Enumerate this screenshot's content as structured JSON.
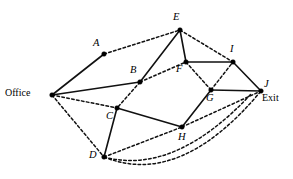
{
  "figure": {
    "type": "graph-diagram",
    "background_color": "#ffffff",
    "line_color": "#111111",
    "node_color": "#000000",
    "width": 293,
    "height": 179
  },
  "nodes": [
    {
      "id": "Office",
      "label": "Office",
      "style": "plain",
      "x": 52,
      "y": 95,
      "label_x": 5,
      "label_y": 88
    },
    {
      "id": "A",
      "label": "A",
      "style": "italic",
      "x": 104,
      "y": 54,
      "label_x": 93,
      "label_y": 38
    },
    {
      "id": "B",
      "label": "B",
      "style": "italic",
      "x": 140,
      "y": 82,
      "label_x": 130,
      "label_y": 65
    },
    {
      "id": "C",
      "label": "C",
      "style": "italic",
      "x": 117,
      "y": 108,
      "label_x": 106,
      "label_y": 111
    },
    {
      "id": "D",
      "label": "D",
      "style": "italic",
      "x": 104,
      "y": 157,
      "label_x": 89,
      "label_y": 150
    },
    {
      "id": "E",
      "label": "E",
      "style": "italic",
      "x": 180,
      "y": 30,
      "label_x": 173,
      "label_y": 12
    },
    {
      "id": "F",
      "label": "F",
      "style": "italic",
      "x": 186,
      "y": 62,
      "label_x": 176,
      "label_y": 64
    },
    {
      "id": "G",
      "label": "G",
      "style": "italic",
      "x": 211,
      "y": 90,
      "label_x": 206,
      "label_y": 93
    },
    {
      "id": "H",
      "label": "H",
      "style": "italic",
      "x": 182,
      "y": 127,
      "label_x": 178,
      "label_y": 132
    },
    {
      "id": "I",
      "label": "I",
      "style": "italic",
      "x": 233,
      "y": 62,
      "label_x": 230,
      "label_y": 44
    },
    {
      "id": "J",
      "label": "J",
      "style": "italic",
      "x": 261,
      "y": 91,
      "label_x": 264,
      "label_y": 79
    },
    {
      "id": "Exit",
      "label": "Exit",
      "style": "plain",
      "x": -1,
      "y": -1,
      "label_x": 262,
      "label_y": 93
    }
  ],
  "edges": [
    {
      "from": "Office",
      "to": "A",
      "style": "solid",
      "path": "M52,95 L104,54"
    },
    {
      "from": "Office",
      "to": "B",
      "style": "solid",
      "path": "M52,95 L140,82"
    },
    {
      "from": "Office",
      "to": "C",
      "style": "dashed",
      "path": "M52,95 L117,108"
    },
    {
      "from": "Office",
      "to": "D",
      "style": "dashed",
      "path": "M52,95 L104,157"
    },
    {
      "from": "A",
      "to": "E",
      "style": "dashed",
      "path": "M104,54 L180,30"
    },
    {
      "from": "B",
      "to": "E",
      "style": "solid",
      "path": "M140,82 L180,30"
    },
    {
      "from": "B",
      "to": "C",
      "style": "dashed",
      "path": "M140,82 L117,108"
    },
    {
      "from": "B",
      "to": "F",
      "style": "dashed",
      "path": "M140,82 L186,62"
    },
    {
      "from": "C",
      "to": "D",
      "style": "solid",
      "path": "M117,108 L104,157"
    },
    {
      "from": "C",
      "to": "H",
      "style": "solid",
      "path": "M117,108 L182,127"
    },
    {
      "from": "D",
      "to": "H",
      "style": "dashed",
      "path": "M104,157 L182,127"
    },
    {
      "from": "D",
      "to": "J",
      "style": "dashed",
      "path": "M104,157 Q180,188 261,91"
    },
    {
      "from": "D",
      "to": "J",
      "style": "dashed",
      "path": "M104,157 Q175,176 252,93"
    },
    {
      "from": "E",
      "to": "F",
      "style": "solid",
      "path": "M180,30 L186,62"
    },
    {
      "from": "E",
      "to": "I",
      "style": "dashed",
      "path": "M180,30 L233,62"
    },
    {
      "from": "F",
      "to": "I",
      "style": "solid",
      "path": "M186,62 L233,62"
    },
    {
      "from": "F",
      "to": "G",
      "style": "dashed",
      "path": "M186,62 L211,90"
    },
    {
      "from": "G",
      "to": "H",
      "style": "solid",
      "path": "M211,90 L182,127"
    },
    {
      "from": "G",
      "to": "J",
      "style": "solid",
      "path": "M211,90 L261,91"
    },
    {
      "from": "G",
      "to": "I",
      "style": "dashed",
      "path": "M211,90 L233,62"
    },
    {
      "from": "H",
      "to": "J",
      "style": "dashed",
      "path": "M182,127 L261,91"
    },
    {
      "from": "I",
      "to": "J",
      "style": "solid",
      "path": "M233,62 L261,91"
    }
  ]
}
